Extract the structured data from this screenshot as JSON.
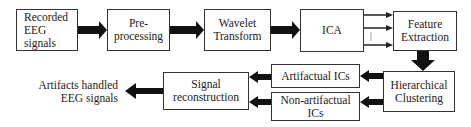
{
  "diagram": {
    "nodes": {
      "recorded": "Recorded EEG signals",
      "recorded_lines": [
        "Recorded",
        "EEG",
        "signals"
      ],
      "preprocessing_lines": [
        "Pre-",
        "processing"
      ],
      "wavelet_lines": [
        "Wavelet",
        "Transform"
      ],
      "ica": "ICA",
      "feature_lines": [
        "Feature",
        "Extraction"
      ],
      "clustering_lines": [
        "Hierarchical",
        "Clustering"
      ],
      "artifactual": "Artifactual ICs",
      "nonartifactual_lines": [
        "Non-artifactual",
        "ICs"
      ],
      "reconstruction_lines": [
        "Signal",
        "reconstruction"
      ],
      "output_lines": [
        "Artifacts handled",
        "EEG signals"
      ]
    },
    "edges": [
      {
        "from": "Recorded EEG signals",
        "to": "Pre-processing"
      },
      {
        "from": "Pre-processing",
        "to": "Wavelet Transform"
      },
      {
        "from": "Wavelet Transform",
        "to": "ICA"
      },
      {
        "from": "ICA",
        "to": "Feature Extraction",
        "note": "multiple component arrows"
      },
      {
        "from": "Feature Extraction",
        "to": "Hierarchical Clustering"
      },
      {
        "from": "Hierarchical Clustering",
        "to": "Artifactual ICs"
      },
      {
        "from": "Hierarchical Clustering",
        "to": "Non-artifactual ICs"
      },
      {
        "from": "Artifactual ICs",
        "to": "Signal reconstruction"
      },
      {
        "from": "Non-artifactual ICs",
        "to": "Signal reconstruction"
      },
      {
        "from": "Signal reconstruction",
        "to": "Artifacts handled EEG signals"
      }
    ]
  }
}
